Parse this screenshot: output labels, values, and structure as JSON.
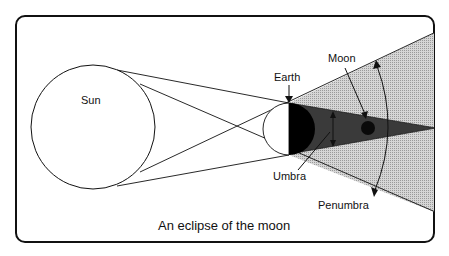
{
  "diagram": {
    "caption": "An eclipse of the moon",
    "labels": {
      "sun": "Sun",
      "earth": "Earth",
      "moon": "Moon",
      "umbra": "Umbra",
      "penumbra": "Penumbra"
    },
    "colors": {
      "frame": "#111111",
      "penumbra": "#c8c8c8",
      "umbra": "#3a3a3a",
      "earth_night": "#000000",
      "moon": "#0a0a0a",
      "background": "#ffffff"
    }
  }
}
